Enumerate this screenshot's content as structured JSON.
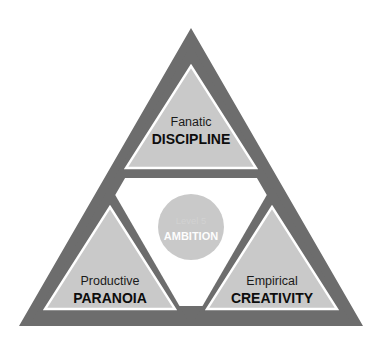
{
  "diagram": {
    "type": "nested-triangle-venn",
    "colors": {
      "band": "#6d6d6d",
      "panel_fill": "#c9c9c9",
      "panel_stroke": "#ffffff",
      "background": "#ffffff",
      "circle_fill": "#c9c9c9",
      "circle_label_top": "#d2d2d2",
      "circle_label_main": "#fdfdfd",
      "text_normal": "#1a1a1a",
      "text_bold": "#0d0d0d"
    },
    "center": {
      "name": "level-5-ambition",
      "line1": "Level 5",
      "line2": "AMBITION"
    },
    "panels": [
      {
        "id": "discipline",
        "position": "top",
        "line1": "Fanatic",
        "line2": "DISCIPLINE"
      },
      {
        "id": "paranoia",
        "position": "bottom-left",
        "line1": "Productive",
        "line2": "PARANOIA"
      },
      {
        "id": "creativity",
        "position": "bottom-right",
        "line1": "Empirical",
        "line2": "CREATIVITY"
      }
    ]
  }
}
